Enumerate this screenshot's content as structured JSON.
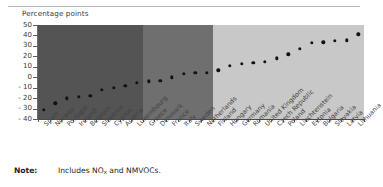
{
  "axis_title": "Percentage points",
  "note": {
    "label": "Note:",
    "text_before_sub": "Includes NO",
    "sub": "x",
    "text_after_sub": " and NMVOCs."
  },
  "colors": {
    "band_dark": "#545454",
    "band_medium": "#6f6f6f",
    "band_light": "#c8c8c8",
    "dot": "#121212",
    "axis": "#5c5c5c",
    "rule": "#b9b9b9"
  },
  "chart_data": {
    "type": "scatter",
    "title": "",
    "subtitle": "",
    "xlabel": "",
    "ylabel": "Percentage points",
    "ylim": [
      -40,
      50
    ],
    "yticks": [
      50,
      40,
      30,
      20,
      10,
      0,
      -10,
      -20,
      -30,
      -40
    ],
    "ytick_labels": [
      "50",
      "40",
      "30",
      "20",
      "10",
      "0",
      "- 10",
      "- 20",
      "- 30",
      "- 40"
    ],
    "grid": false,
    "legend_position": "none",
    "categories": [
      "Spain",
      "Norway",
      "Portugal",
      "Ireland",
      "Belgium",
      "Slovenia",
      "Cyprus",
      "Austria",
      "Luxembourg",
      "Greece",
      "Denmark",
      "France",
      "Italy",
      "Sweden",
      "Netherlands",
      "Finland",
      "Hungary",
      "Germany",
      "Romania",
      "United Kingdom",
      "Czech Republic",
      "Poland",
      "Liechtenstein",
      "Estonia",
      "Bulgaria",
      "Slovakia",
      "Latvia",
      "Lithuania"
    ],
    "values": [
      -31,
      -25,
      -20,
      -18.5,
      -18,
      -12,
      -10,
      -8,
      -5.5,
      -4,
      -3.5,
      0,
      3,
      4,
      4.5,
      6.5,
      11,
      13,
      14,
      15,
      18,
      22,
      27,
      33,
      33.5,
      35,
      35.5,
      41
    ],
    "bands": [
      {
        "name": "group-dark",
        "color": "#545454",
        "start_index": 0,
        "end_index": 8
      },
      {
        "name": "group-medium",
        "color": "#6f6f6f",
        "start_index": 9,
        "end_index": 14
      },
      {
        "name": "group-light",
        "color": "#c8c8c8",
        "start_index": 15,
        "end_index": 27
      }
    ]
  }
}
